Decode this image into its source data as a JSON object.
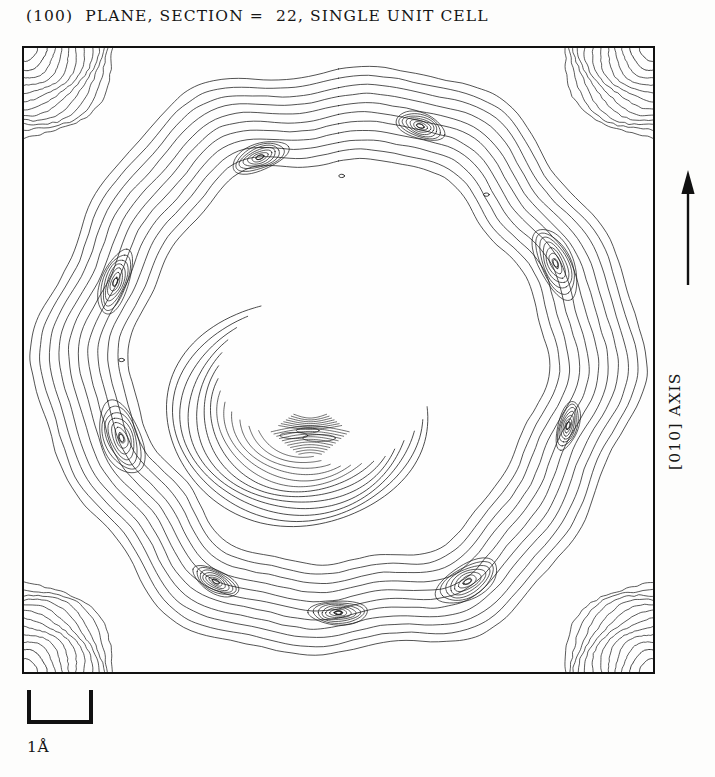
{
  "figure": {
    "title": "(100)  PLANE, SECTION =  22, SINGLE UNIT CELL",
    "axis_label": "[010] AXIS",
    "scale_label": "1Å",
    "arrow_icon": "up-arrow-icon",
    "line_color": "#1a1a1a",
    "frame_color": "#111111",
    "background_color": "#fefefe"
  },
  "chart_data": {
    "type": "contour",
    "title": "(100)  PLANE, SECTION =  22, SINGLE UNIT CELL",
    "subtitle": "",
    "xlabel": "",
    "ylabel": "[010] AXIS",
    "grid": false,
    "legend": "none",
    "axis_ranges": {
      "x": [
        0,
        1
      ],
      "y": [
        0,
        1
      ]
    },
    "units": "fractional unit-cell coordinates",
    "scale_bar_length_angstrom": 1,
    "section_index": 22,
    "plane": "(100)",
    "cell_description": "SINGLE UNIT CELL",
    "contour_interval_note": "uniform electron-density contour levels",
    "n_levels": 14,
    "levels": [
      1,
      2,
      3,
      4,
      5,
      6,
      7,
      8,
      9,
      10,
      11,
      12,
      13,
      14
    ],
    "features": [
      {
        "name": "corner-atom-top-left",
        "kind": "quarter-circle-peak",
        "cx": 0.0,
        "cy": 0.0,
        "rings": 12,
        "max_radius": 0.145
      },
      {
        "name": "corner-atom-top-right",
        "kind": "quarter-circle-peak",
        "cx": 1.0,
        "cy": 0.0,
        "rings": 12,
        "max_radius": 0.145
      },
      {
        "name": "corner-atom-bottom-left",
        "kind": "quarter-circle-peak",
        "cx": 0.0,
        "cy": 1.0,
        "rings": 12,
        "max_radius": 0.145
      },
      {
        "name": "corner-atom-bottom-right",
        "kind": "quarter-circle-peak",
        "cx": 1.0,
        "cy": 1.0,
        "rings": 12,
        "max_radius": 0.145
      },
      {
        "name": "outer-ring-band",
        "kind": "annular-band",
        "cx": 0.5,
        "cy": 0.5,
        "mean_radius": 0.385,
        "band_rings": 11
      },
      {
        "name": "central-crescent",
        "kind": "open-crescent",
        "cx": 0.455,
        "cy": 0.585,
        "radius": 0.145,
        "gap_direction": "north-east",
        "rings": 13
      },
      {
        "name": "ring-lobe-top",
        "kind": "local-max",
        "cx": 0.63,
        "cy": 0.125
      },
      {
        "name": "ring-lobe-top-left",
        "kind": "local-max",
        "cx": 0.375,
        "cy": 0.175
      },
      {
        "name": "ring-lobe-left-upper",
        "kind": "local-max",
        "cx": 0.145,
        "cy": 0.375
      },
      {
        "name": "ring-lobe-left-lower",
        "kind": "local-max",
        "cx": 0.155,
        "cy": 0.625
      },
      {
        "name": "ring-lobe-bottom-left",
        "kind": "local-max",
        "cx": 0.305,
        "cy": 0.855
      },
      {
        "name": "ring-lobe-bottom",
        "kind": "local-max",
        "cx": 0.5,
        "cy": 0.905
      },
      {
        "name": "ring-lobe-bottom-right",
        "kind": "local-max",
        "cx": 0.705,
        "cy": 0.855
      },
      {
        "name": "ring-lobe-right-upper",
        "kind": "local-max",
        "cx": 0.845,
        "cy": 0.345
      },
      {
        "name": "ring-lobe-right-lower",
        "kind": "local-max",
        "cx": 0.865,
        "cy": 0.605
      }
    ]
  }
}
